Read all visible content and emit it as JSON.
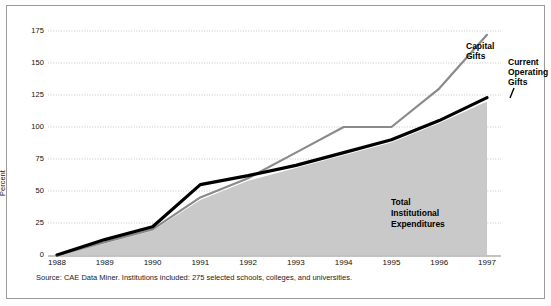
{
  "figure": {
    "axis_title": "Percent",
    "source_note": "Source: CAE Data Miner. Institutions included: 275 selected schools, colleges, and universities.",
    "label_capital": "Capital",
    "label_capital2": "Gifts",
    "label_current": "Current",
    "label_current2": "Operating",
    "label_current3": "Gifts",
    "label_area1": "Total",
    "label_area2": "Institutional",
    "label_area3": "Expenditures",
    "colors": {
      "capital_gifts": "#8a8a8a",
      "current_operating_gifts": "#000000",
      "area_fill": "#c9c9c9",
      "gridline": "#b5b5b5",
      "border": "#9a9a9a",
      "background": "#ffffff"
    }
  },
  "chart_data": {
    "type": "line",
    "title": "",
    "subtitle": "",
    "xlabel": "",
    "ylabel": "Percent",
    "x": [
      1988,
      1989,
      1990,
      1991,
      1992,
      1993,
      1994,
      1995,
      1996,
      1997
    ],
    "categories": [
      "1988",
      "1989",
      "1990",
      "1991",
      "1992",
      "1993",
      "1994",
      "1995",
      "1996",
      "1997"
    ],
    "xtick_labels": [
      "1988",
      "1989",
      "1990",
      "1991",
      "1992",
      "1993",
      "1994",
      "1995",
      "1996",
      "1997"
    ],
    "ytick_labels": [
      "0",
      "25",
      "50",
      "75",
      "100",
      "125",
      "150",
      "175"
    ],
    "yticks": [
      0,
      25,
      50,
      75,
      100,
      125,
      150,
      175
    ],
    "ylim": [
      0,
      180
    ],
    "xlim": [
      1988,
      1997
    ],
    "grid": true,
    "grid_axis": "y",
    "legend": "inline-annotations",
    "series": [
      {
        "name": "Capital Gifts",
        "color": "#8a8a8a",
        "style": "line",
        "values": [
          0,
          10,
          20,
          45,
          60,
          80,
          100,
          100,
          130,
          172
        ]
      },
      {
        "name": "Current Operating Gifts",
        "color": "#000000",
        "style": "line",
        "values": [
          0,
          12,
          22,
          55,
          62,
          70,
          80,
          90,
          105,
          123
        ]
      },
      {
        "name": "Total Institutional Expenditures",
        "color": "#c9c9c9",
        "style": "area",
        "values": [
          0,
          9,
          19,
          43,
          58,
          68,
          78,
          88,
          103,
          120
        ]
      }
    ],
    "annotations": [
      {
        "text": "Capital Gifts",
        "series": "Capital Gifts"
      },
      {
        "text": "Current Operating Gifts",
        "series": "Current Operating Gifts"
      },
      {
        "text": "Total Institutional Expenditures",
        "series": "Total Institutional Expenditures"
      }
    ],
    "source": "Source: CAE Data Miner. Institutions included: 275 selected schools, colleges, and universities."
  }
}
